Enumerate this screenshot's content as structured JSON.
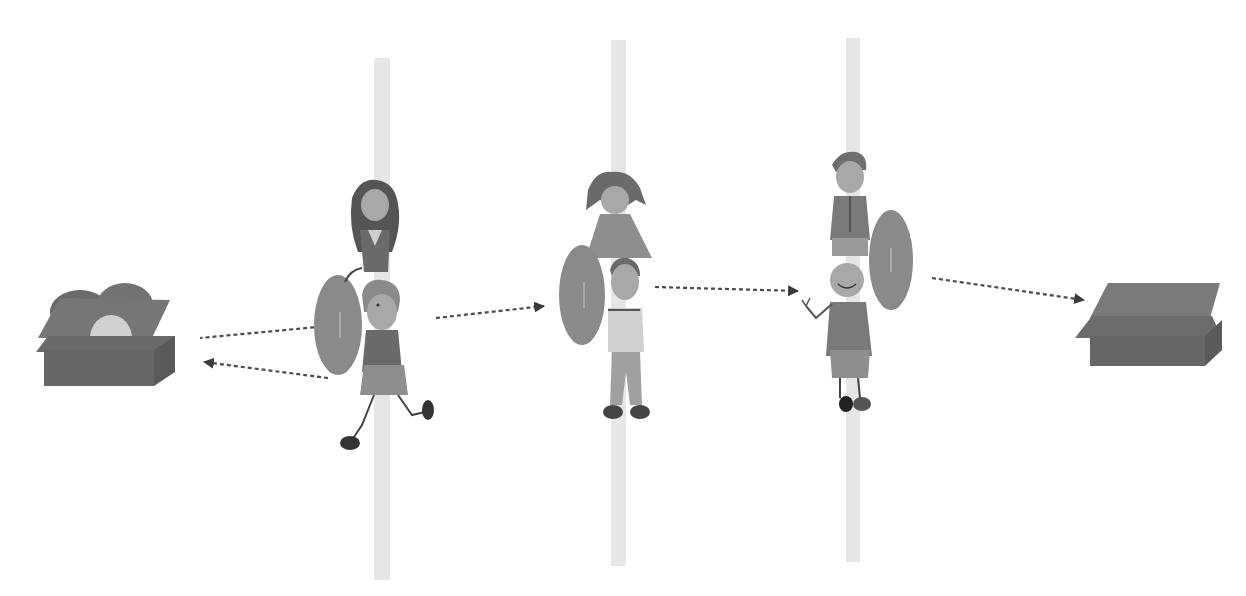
{
  "diagram": {
    "description": "Relay passing a disc from a box of balls, through three pole stations with children, to an empty box",
    "colors": {
      "background": "#ffffff",
      "pole": "#e6e6e6",
      "box_front": "#6e6e6e",
      "box_top": "#7a7a7a",
      "box_side": "#5e5e5e",
      "disc": "#8a8a8a",
      "arrow": "#4a4a4a",
      "skin": "#a8a8a8",
      "hair": "#5a5a5a",
      "shirt": "#6a6a6a",
      "light_shirt": "#c9c9c9",
      "pants": "#9a9a9a",
      "shoe": "#333333"
    },
    "nodes": [
      {
        "id": "source-box",
        "label": "",
        "kind": "box-with-balls"
      },
      {
        "id": "station-1",
        "label": "",
        "kind": "pole-with-two-children"
      },
      {
        "id": "station-2",
        "label": "",
        "kind": "pole-with-two-children"
      },
      {
        "id": "station-3",
        "label": "",
        "kind": "pole-with-two-children"
      },
      {
        "id": "target-box",
        "label": "",
        "kind": "empty-box"
      }
    ],
    "edges": [
      {
        "from": "station-1",
        "to": "source-box",
        "style": "dashed",
        "direction": "incoming-line"
      },
      {
        "from": "station-1",
        "to": "source-box",
        "style": "dashed-arrow"
      },
      {
        "from": "station-1",
        "to": "station-2",
        "style": "dashed-arrow"
      },
      {
        "from": "station-2",
        "to": "station-3",
        "style": "dashed-arrow"
      },
      {
        "from": "station-3",
        "to": "target-box",
        "style": "dashed-arrow"
      }
    ]
  }
}
